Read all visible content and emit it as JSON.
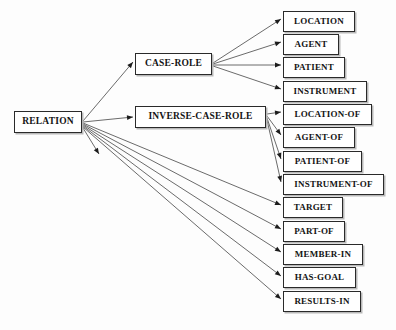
{
  "diagram": {
    "background_color": "#fdfdfd",
    "box_fill_color": "#ffffff",
    "box_border_color": "#2a2a2a",
    "box_shadow_color": "#b9b9b9",
    "edge_color": "#3a3a3a",
    "text_color": "#141414"
  },
  "nodes": [
    {
      "id": "relation",
      "label": "RELATION",
      "x": 14,
      "y": 111,
      "w": 68,
      "h": 22,
      "font_size": 9.5,
      "level": 0
    },
    {
      "id": "case-role",
      "label": "CASE-ROLE",
      "x": 135,
      "y": 53,
      "w": 77,
      "h": 22,
      "font_size": 9.5,
      "level": 1
    },
    {
      "id": "inverse-case-role",
      "label": "INVERSE-CASE-ROLE",
      "x": 135,
      "y": 106,
      "w": 131,
      "h": 22,
      "font_size": 9.5,
      "level": 1
    },
    {
      "id": "location",
      "label": "LOCATION",
      "x": 283,
      "y": 11,
      "w": 72,
      "h": 20.5,
      "font_size": 9,
      "level": 2
    },
    {
      "id": "agent",
      "label": "AGENT",
      "x": 283,
      "y": 34,
      "w": 56,
      "h": 20.5,
      "font_size": 9,
      "level": 2
    },
    {
      "id": "patient",
      "label": "PATIENT",
      "x": 283,
      "y": 57,
      "w": 62,
      "h": 20.5,
      "font_size": 9,
      "level": 2
    },
    {
      "id": "instrument",
      "label": "INSTRUMENT",
      "x": 283,
      "y": 81,
      "w": 84,
      "h": 20.5,
      "font_size": 9,
      "level": 2
    },
    {
      "id": "location-of",
      "label": "LOCATION-OF",
      "x": 283,
      "y": 104,
      "w": 89,
      "h": 20.5,
      "font_size": 9,
      "level": 2
    },
    {
      "id": "agent-of",
      "label": "AGENT-OF",
      "x": 283,
      "y": 127,
      "w": 72,
      "h": 20.5,
      "font_size": 9,
      "level": 2
    },
    {
      "id": "patient-of",
      "label": "PATIENT-OF",
      "x": 283,
      "y": 151,
      "w": 79,
      "h": 20.5,
      "font_size": 9,
      "level": 2
    },
    {
      "id": "instrument-of",
      "label": "INSTRUMENT-OF",
      "x": 283,
      "y": 174,
      "w": 101,
      "h": 20.5,
      "font_size": 9,
      "level": 2
    },
    {
      "id": "target",
      "label": "TARGET",
      "x": 283,
      "y": 197,
      "w": 60,
      "h": 20.5,
      "font_size": 9,
      "level": 2
    },
    {
      "id": "part-of",
      "label": "PART-OF",
      "x": 283,
      "y": 221,
      "w": 62,
      "h": 20.5,
      "font_size": 9,
      "level": 2
    },
    {
      "id": "member-in",
      "label": "MEMBER-IN",
      "x": 283,
      "y": 244,
      "w": 80,
      "h": 20.5,
      "font_size": 9,
      "level": 2
    },
    {
      "id": "has-goal",
      "label": "HAS-GOAL",
      "x": 283,
      "y": 267,
      "w": 73,
      "h": 20.5,
      "font_size": 9,
      "level": 2
    },
    {
      "id": "results-in",
      "label": "RESULTS-IN",
      "x": 283,
      "y": 291,
      "w": 78,
      "h": 20.5,
      "font_size": 9,
      "level": 2
    }
  ],
  "edges": [
    {
      "from": "relation",
      "to": "case-role",
      "x1": 83,
      "y1": 121,
      "x2": 133,
      "y2": 62
    },
    {
      "from": "relation",
      "to": "inverse-case-role",
      "x1": 83,
      "y1": 122,
      "x2": 133,
      "y2": 117
    },
    {
      "from": "relation",
      "to": "target",
      "x1": 83,
      "y1": 123,
      "x2": 281,
      "y2": 205
    },
    {
      "from": "relation",
      "to": "part-of",
      "x1": 83,
      "y1": 124,
      "x2": 281,
      "y2": 229
    },
    {
      "from": "relation",
      "to": "member-in",
      "x1": 83,
      "y1": 125,
      "x2": 281,
      "y2": 252
    },
    {
      "from": "relation",
      "to": "has-goal",
      "x1": 83,
      "y1": 126,
      "x2": 281,
      "y2": 276
    },
    {
      "from": "relation",
      "to": "results-in",
      "x1": 83,
      "y1": 127,
      "x2": 281,
      "y2": 299
    },
    {
      "from": "relation",
      "to": "dangling",
      "x1": 83,
      "y1": 128,
      "x2": 99,
      "y2": 154
    },
    {
      "from": "case-role",
      "to": "location",
      "x1": 213,
      "y1": 63,
      "x2": 281,
      "y2": 19
    },
    {
      "from": "case-role",
      "to": "agent",
      "x1": 213,
      "y1": 64,
      "x2": 281,
      "y2": 42
    },
    {
      "from": "case-role",
      "to": "patient",
      "x1": 213,
      "y1": 65,
      "x2": 281,
      "y2": 65
    },
    {
      "from": "case-role",
      "to": "instrument",
      "x1": 213,
      "y1": 66,
      "x2": 281,
      "y2": 89
    },
    {
      "from": "inverse-case-role",
      "to": "location-of",
      "x1": 267,
      "y1": 114,
      "x2": 281,
      "y2": 112
    },
    {
      "from": "inverse-case-role",
      "to": "agent-of",
      "x1": 267,
      "y1": 116,
      "x2": 281,
      "y2": 135
    },
    {
      "from": "inverse-case-role",
      "to": "patient-of",
      "x1": 267,
      "y1": 118,
      "x2": 281,
      "y2": 159
    },
    {
      "from": "inverse-case-role",
      "to": "instrument-of",
      "x1": 267,
      "y1": 120,
      "x2": 281,
      "y2": 182
    }
  ]
}
